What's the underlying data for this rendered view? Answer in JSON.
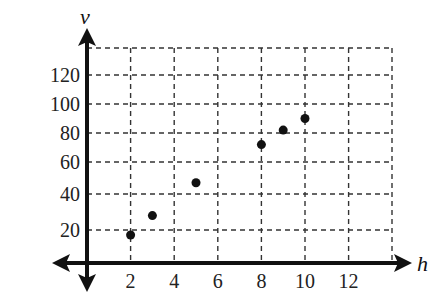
{
  "chart_data": {
    "type": "scatter",
    "title": "",
    "xlabel": "h",
    "ylabel": "v",
    "x_ticks": [
      2,
      4,
      6,
      8,
      10,
      12
    ],
    "y_ticks": [
      20,
      40,
      60,
      80,
      100,
      120
    ],
    "xlim": [
      0,
      14
    ],
    "ylim": [
      0,
      140
    ],
    "grid": true,
    "grid_style": "dashed",
    "legend": null,
    "points": [
      {
        "x": 2,
        "y": 17
      },
      {
        "x": 3,
        "y": 28
      },
      {
        "x": 5,
        "y": 47
      },
      {
        "x": 8,
        "y": 72
      },
      {
        "x": 9,
        "y": 82
      },
      {
        "x": 10,
        "y": 90
      }
    ]
  },
  "labels": {
    "x_axis": "h",
    "y_axis": "v"
  },
  "colors": {
    "axis": "#111111",
    "grid": "#333333",
    "point": "#111111",
    "text": "#222222"
  }
}
